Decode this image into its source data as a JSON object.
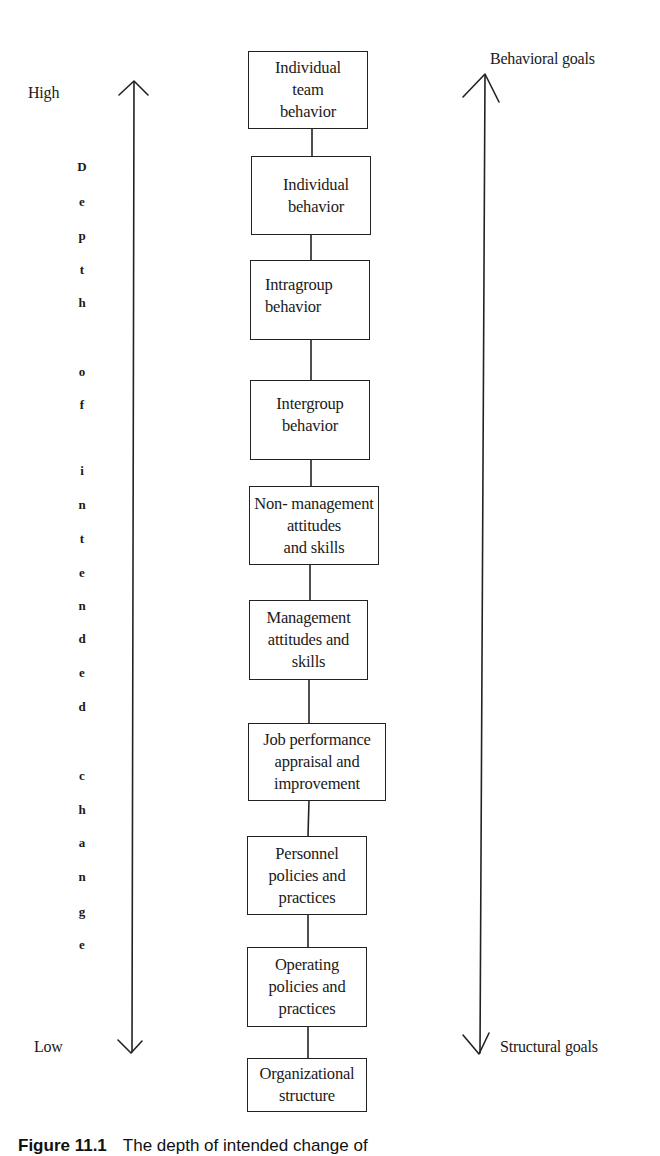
{
  "diagram": {
    "type": "vertical-hierarchy",
    "left_axis": {
      "top_label": "High",
      "bottom_label": "Low",
      "vertical_title": "Depth of intended change",
      "letters": [
        "D",
        "e",
        "p",
        "t",
        "h",
        "o",
        "f",
        "i",
        "n",
        "t",
        "e",
        "n",
        "d",
        "e",
        "d",
        "c",
        "h",
        "a",
        "n",
        "g",
        "e"
      ]
    },
    "right_axis": {
      "top_label": "Behavioral goals",
      "bottom_label": "Structural goals"
    },
    "boxes": [
      {
        "label": "Individual\nteam\nbehavior"
      },
      {
        "label": "Individual\nbehavior"
      },
      {
        "label": "Intragroup\nbehavior"
      },
      {
        "label": "Intergroup\nbehavior"
      },
      {
        "label": "Non- management\nattitudes\nand skills"
      },
      {
        "label": "Management\nattitudes and\nskills"
      },
      {
        "label": "Job performance\nappraisal and\nimprovement"
      },
      {
        "label": "Personnel\npolicies and\npractices"
      },
      {
        "label": "Operating\npolicies and\npractices"
      },
      {
        "label": "Organizational\nstructure"
      }
    ],
    "caption": {
      "figure_number": "Figure 11.1",
      "text": "The depth of intended change of"
    }
  }
}
